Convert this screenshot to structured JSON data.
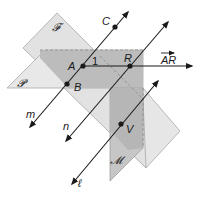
{
  "diagram": {
    "planes": {
      "F": {
        "label": "𝓕",
        "fill": "#dcdcdc"
      },
      "P": {
        "label": "𝓟",
        "fill": "#e4e4e4"
      },
      "M": {
        "label": "𝓜",
        "fill": "#c4c4c4"
      },
      "overlap_fill": "#b4b4b4",
      "light_fill": "#e8e8e8",
      "edge_color": "#9a9a9a"
    },
    "points": {
      "A": "A",
      "B": "B",
      "C": "C",
      "R": "R",
      "V": "V"
    },
    "lines": {
      "m": "m",
      "n": "n",
      "l": "ℓ"
    },
    "ray_label": "AR",
    "angle_label": "1",
    "line_color": "#1a1a1a"
  }
}
